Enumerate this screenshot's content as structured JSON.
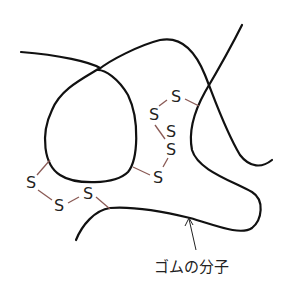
{
  "diagram": {
    "type": "vulcanized rubber molecular structure",
    "colors": {
      "chain": "#111111",
      "bond": "#8a5a55",
      "text": "#222222",
      "background": "#ffffff"
    },
    "label": "ゴムの分子",
    "crosslinks": [
      {
        "name": "upper-right-bridge",
        "atoms": [
          "S",
          "S",
          "S",
          "S",
          "S"
        ]
      },
      {
        "name": "lower-left-bridge",
        "atoms": [
          "S",
          "S",
          "S"
        ]
      }
    ],
    "atom_symbol": "S"
  }
}
